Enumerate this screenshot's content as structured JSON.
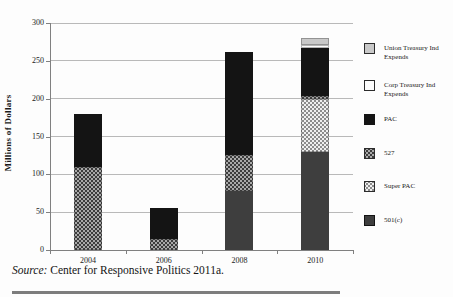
{
  "figure": {
    "source_prefix": "Source:",
    "source_text": " Center for Responsive Politics 2011a."
  },
  "chart_data": {
    "type": "bar",
    "stacked": true,
    "title": "",
    "xlabel": "",
    "ylabel": "Millions of Dollars",
    "ylim": [
      0,
      300
    ],
    "yticks": [
      0,
      50,
      100,
      150,
      200,
      250,
      300
    ],
    "grid": true,
    "legend_position": "right",
    "categories": [
      "2004",
      "2006",
      "2008",
      "2010"
    ],
    "series": [
      {
        "name": "501(c)",
        "pattern": "solid-darkgray",
        "color": "#3e3e3e",
        "values": [
          0,
          0,
          78,
          130
        ]
      },
      {
        "name": "Super PAC",
        "pattern": "dotgrid-light",
        "color": "#efefef",
        "values": [
          0,
          0,
          0,
          70
        ]
      },
      {
        "name": "527",
        "pattern": "dots-gray",
        "color": "#a9a9a9",
        "values": [
          110,
          15,
          48,
          4
        ]
      },
      {
        "name": "PAC",
        "pattern": "solid-black",
        "color": "#141414",
        "values": [
          70,
          40,
          136,
          63
        ]
      },
      {
        "name": "Corp Treasury Ind Expends",
        "pattern": "solid-white",
        "color": "#fdfdfd",
        "values": [
          0,
          0,
          0,
          4
        ]
      },
      {
        "name": "Union Treasury Ind Expends",
        "pattern": "solid-lightgray",
        "color": "#c9c9c9",
        "values": [
          0,
          0,
          0,
          9
        ]
      }
    ],
    "legend_items": [
      {
        "label_lines": [
          "Union Treasury Ind",
          "Expends"
        ],
        "pattern": "solid-lightgray"
      },
      {
        "label_lines": [
          "Corp Treasury Ind",
          "Expends"
        ],
        "pattern": "solid-white"
      },
      {
        "label_lines": [
          "PAC"
        ],
        "pattern": "solid-black"
      },
      {
        "label_lines": [
          "527"
        ],
        "pattern": "dots-gray"
      },
      {
        "label_lines": [
          "Super PAC"
        ],
        "pattern": "dotgrid-light"
      },
      {
        "label_lines": [
          "501(c)"
        ],
        "pattern": "solid-darkgray"
      }
    ]
  }
}
